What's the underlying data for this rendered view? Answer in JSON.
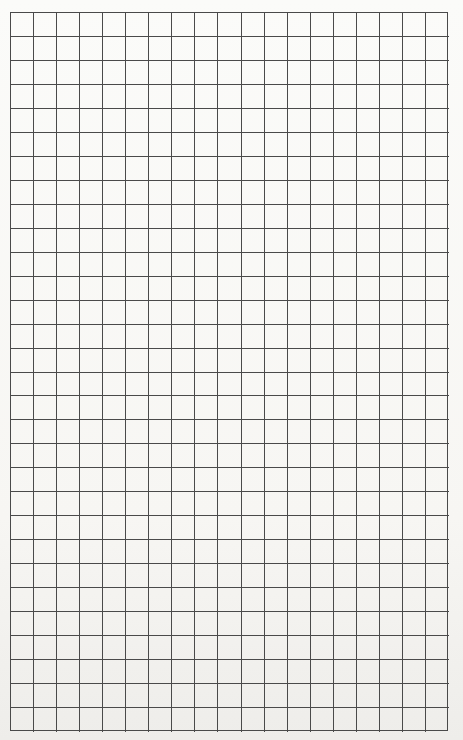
{
  "document": {
    "type": "graph-paper",
    "header_text": "",
    "grid": {
      "columns": 19,
      "rows": 30,
      "left": 10,
      "top": 12,
      "width": 438,
      "height": 719,
      "line_color": "#4a4a4a",
      "paper_color": "#f7f6f3"
    }
  }
}
